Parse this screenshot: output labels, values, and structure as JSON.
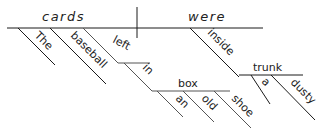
{
  "diagram": {
    "type": "sentence-diagram",
    "subject": "cards",
    "verb": "were",
    "subject_modifiers": [
      "The",
      "baseball"
    ],
    "participle": "left",
    "participle_prep": "in",
    "participle_object": "box",
    "participle_object_modifiers": [
      "an",
      "old",
      "shoe"
    ],
    "verb_prep": "inside",
    "verb_prep_object": "trunk",
    "verb_prep_object_modifiers": [
      "a",
      "dusty"
    ]
  },
  "colors": {
    "line": "#1a1a1a",
    "text": "#222222"
  }
}
